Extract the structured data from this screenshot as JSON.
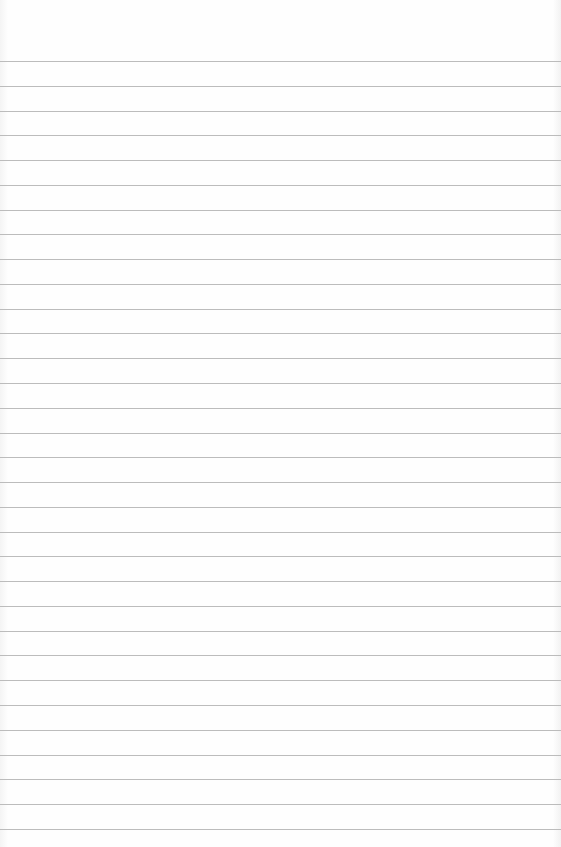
{
  "paper": {
    "background": "#fdfdfd",
    "line_color": "#bcbcbc",
    "first_line_y": 61,
    "line_spacing": 24.77,
    "line_count": 32
  }
}
